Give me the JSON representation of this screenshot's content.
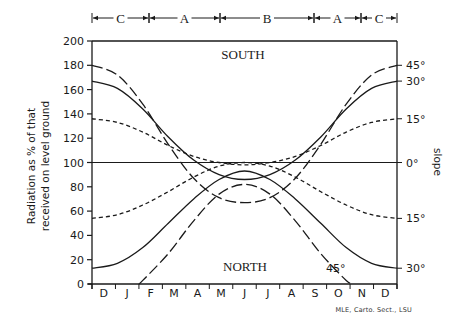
{
  "chart_data": {
    "type": "line",
    "title": "",
    "ylabel": "Radiation as % of that received on level ground",
    "ylabel_lines": [
      "Radiation as % of that",
      "received on level ground"
    ],
    "right_label": "slope",
    "xlabel": "",
    "ylim": [
      0,
      200
    ],
    "yticks": [
      0,
      20,
      40,
      60,
      80,
      100,
      120,
      140,
      160,
      180,
      200
    ],
    "month_labels": [
      "D",
      "J",
      "F",
      "M",
      "A",
      "M",
      "J",
      "J",
      "A",
      "S",
      "O",
      "N",
      "D"
    ],
    "region_labels": {
      "south": "SOUTH",
      "north": "NORTH"
    },
    "season_bands": [
      {
        "label": "C",
        "start_x": 92,
        "end_x": 149
      },
      {
        "label": "A",
        "start_x": 149,
        "end_x": 220
      },
      {
        "label": "B",
        "start_x": 220,
        "end_x": 314
      },
      {
        "label": "A",
        "start_x": 314,
        "end_x": 361
      },
      {
        "label": "C",
        "start_x": 361,
        "end_x": 397
      }
    ],
    "x": [
      "Dec",
      "Jan",
      "Feb",
      "Mar",
      "Apr",
      "May",
      "Jun",
      "Jul",
      "Aug",
      "Sep",
      "Oct",
      "Nov",
      "Dec"
    ],
    "series": [
      {
        "name": "South 45°",
        "aspect": "south",
        "slope": "45°",
        "style": "longdash",
        "values": [
          180,
          172,
          148,
          115,
          87,
          71,
          67,
          71,
          87,
          115,
          148,
          172,
          180
        ]
      },
      {
        "name": "South 30°",
        "aspect": "south",
        "slope": "30°",
        "style": "solid",
        "values": [
          167,
          161,
          144,
          121,
          102,
          90,
          86,
          90,
          102,
          121,
          144,
          161,
          167
        ]
      },
      {
        "name": "South 15°",
        "aspect": "south",
        "slope": "15°",
        "style": "shortdash",
        "values": [
          136,
          133,
          125,
          114,
          105,
          100,
          98,
          100,
          105,
          114,
          125,
          133,
          136
        ]
      },
      {
        "name": "Level 0°",
        "aspect": "level",
        "slope": "0°",
        "style": "solid",
        "values": [
          100,
          100,
          100,
          100,
          100,
          100,
          100,
          100,
          100,
          100,
          100,
          100,
          100
        ]
      },
      {
        "name": "North 15°",
        "aspect": "north",
        "slope": "15°",
        "style": "shortdash",
        "values": [
          54,
          57,
          65,
          76,
          88,
          97,
          100,
          97,
          88,
          76,
          65,
          57,
          54
        ]
      },
      {
        "name": "North 30°",
        "aspect": "north",
        "slope": "30°",
        "style": "solid",
        "values": [
          13,
          17,
          30,
          50,
          70,
          86,
          93,
          86,
          70,
          50,
          30,
          17,
          13
        ]
      },
      {
        "name": "North 45°",
        "aspect": "north",
        "slope": "45°",
        "style": "longdash",
        "values": [
          0,
          0,
          3,
          25,
          52,
          74,
          82,
          74,
          52,
          25,
          3,
          0,
          0
        ]
      }
    ],
    "right_slope_labels": [
      {
        "label": "45°",
        "value": 180
      },
      {
        "label": "30°",
        "value": 167
      },
      {
        "label": "15°",
        "value": 136
      },
      {
        "label": "0°",
        "value": 100
      },
      {
        "label": "15°",
        "value": 54
      },
      {
        "label": "30°",
        "value": 13
      }
    ],
    "inline_labels": [
      {
        "label": "45°",
        "series": "North 45°"
      }
    ],
    "grid": false,
    "legend": "none"
  },
  "credit": "MLE, Carto. Sect., LSU"
}
